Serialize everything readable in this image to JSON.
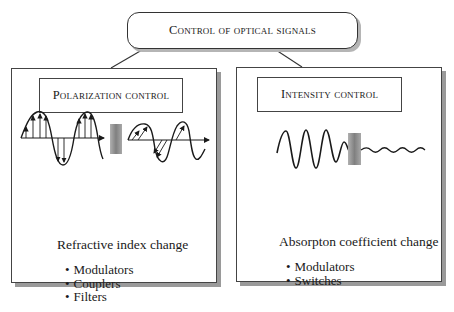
{
  "title": "Control of optical signals",
  "panels": [
    {
      "heading": "Polarization control",
      "mechanism": "Refractive index change",
      "items": [
        "Modulators",
        "Couplers",
        "Filters"
      ],
      "figure": "polarization-rotation-wave"
    },
    {
      "heading": "Intensity control",
      "mechanism": "Absorpton coefficient change",
      "items": [
        "Modulators",
        "Switches"
      ],
      "figure": "attenuated-wave"
    }
  ],
  "colors": {
    "line": "#1a1a1a",
    "shadow": "#9a9a9a",
    "filter": "#8c8c8c"
  }
}
